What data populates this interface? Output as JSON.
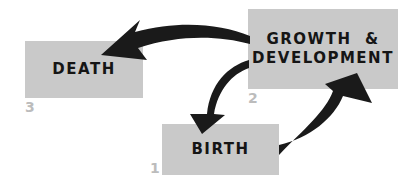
{
  "diagram": {
    "nodes": [
      {
        "id": 1,
        "number": "1",
        "label": "BIRTH"
      },
      {
        "id": 2,
        "number": "2",
        "label_line1": "GROWTH  &",
        "label_line2": "DEVELOPMENT"
      },
      {
        "id": 3,
        "number": "3",
        "label": "DEATH"
      }
    ],
    "edges": [
      {
        "from": "BIRTH",
        "to": "GROWTH & DEVELOPMENT"
      },
      {
        "from": "GROWTH & DEVELOPMENT",
        "to": "DEATH"
      },
      {
        "from": "GROWTH & DEVELOPMENT",
        "to": "BIRTH"
      }
    ],
    "colors": {
      "box": "#c9c9c9",
      "arrow": "#1a1a1a",
      "number": "#bcbcbc",
      "text": "#151515"
    }
  }
}
